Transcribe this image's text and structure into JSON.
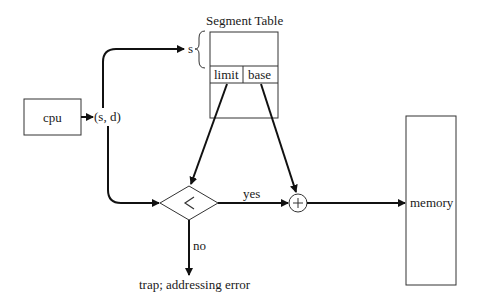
{
  "diagram": {
    "title": "Segment Table",
    "cpu_label": "cpu",
    "logical_address_label": "(s, d)",
    "segment_index_label": "s",
    "table_columns": [
      "limit",
      "base"
    ],
    "comparator_symbol": "<",
    "adder_symbol": "+",
    "yes_label": "yes",
    "no_label": "no",
    "trap_label": "trap; addressing error",
    "memory_label": "memory"
  }
}
